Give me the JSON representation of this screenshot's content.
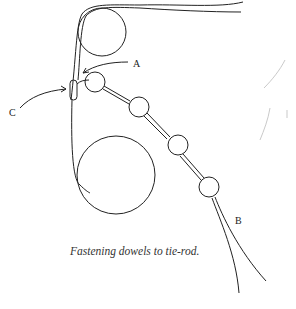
{
  "diagram": {
    "caption": "Fastening dowels to tie-rod.",
    "labels": {
      "a": "A",
      "b": "B",
      "c": "C"
    },
    "stroke_color": "#222222"
  }
}
